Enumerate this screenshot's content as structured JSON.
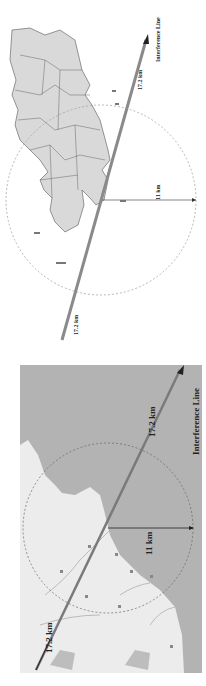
{
  "figure": {
    "panel_top": {
      "type": "schematic island map with district boundaries",
      "labels": {
        "distance_upper": "17.2 km",
        "distance_lower": "17.2 km",
        "radius": "11 km",
        "line_label": "Interference Line"
      },
      "colors": {
        "land": "#d9d9d9",
        "background": "#ffffff",
        "line": "#8a8a8a",
        "circle": "#9a9a9a"
      }
    },
    "panel_bottom": {
      "type": "topographic map with sea area",
      "labels": {
        "distance_upper": "17.2 km",
        "distance_lower": "17.2 km",
        "radius": "11 km",
        "line_label": "Interference Line"
      },
      "colors": {
        "sea": "#b3b3b3",
        "land": "#ececec",
        "line": "#7a7a7a",
        "circle": "#666666"
      }
    }
  }
}
